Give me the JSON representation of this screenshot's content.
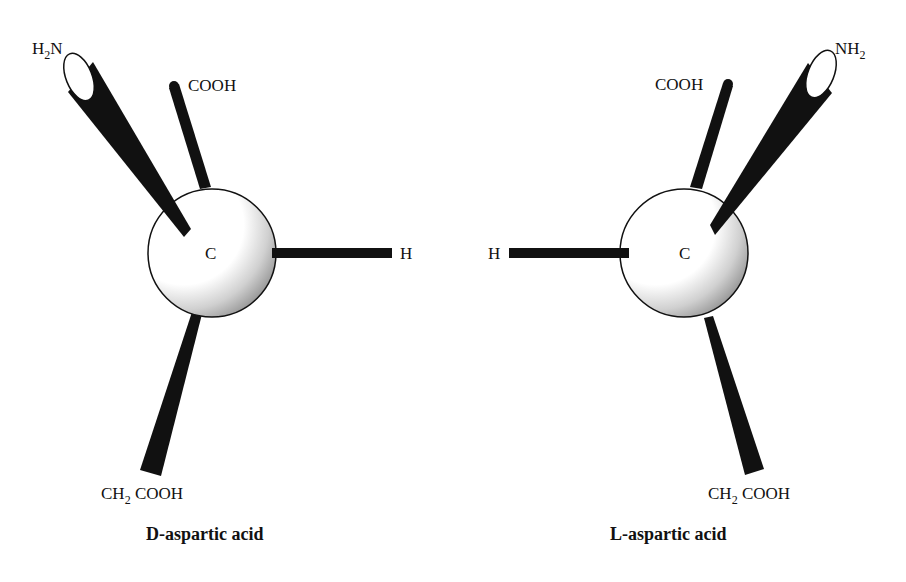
{
  "figure": {
    "type": "stereochemistry-diagram",
    "colors": {
      "bond": "#111111",
      "atom_fill": "#ffffff",
      "shade": "#9a9a9a",
      "text": "#111111"
    },
    "molecules": [
      {
        "id": "d",
        "caption": "D-aspartic acid",
        "center_atom": "C",
        "substituents": {
          "amino": {
            "main": "H",
            "sub": "2",
            "tail": "N"
          },
          "carboxyl": "COOH",
          "hydrogen": "H",
          "side_chain": {
            "main": "CH",
            "sub": "2",
            "tail": " COOH"
          }
        }
      },
      {
        "id": "l",
        "caption": "L-aspartic acid",
        "center_atom": "C",
        "substituents": {
          "amino": {
            "main": "NH",
            "sub": "2"
          },
          "carboxyl": "COOH",
          "hydrogen": "H",
          "side_chain": {
            "main": "CH",
            "sub": "2",
            "tail": " COOH"
          }
        }
      }
    ]
  }
}
